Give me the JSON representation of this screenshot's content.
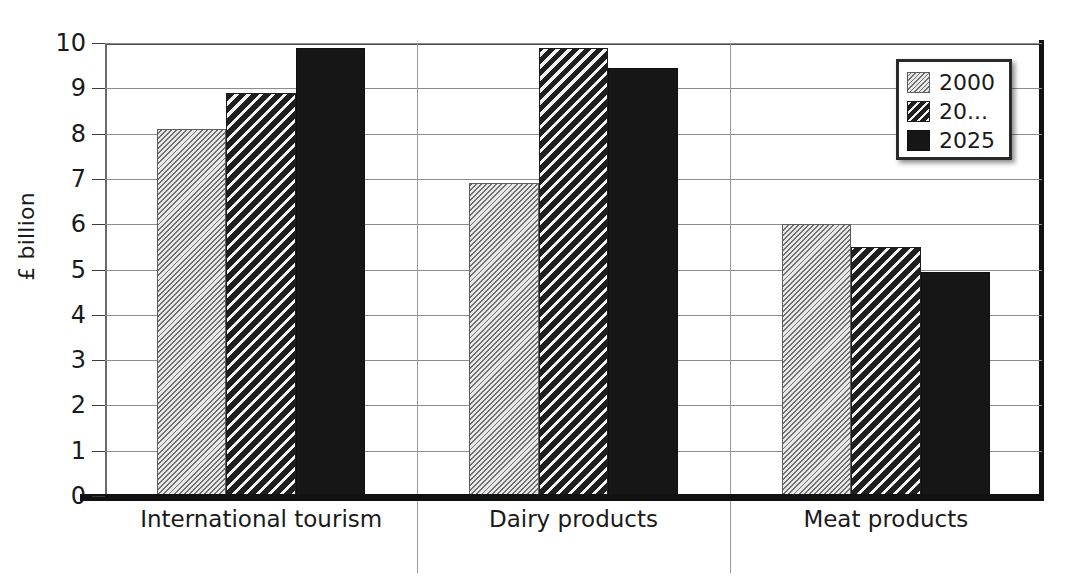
{
  "chart_data": {
    "type": "bar",
    "title": "",
    "xlabel": "",
    "ylabel": "£ billion",
    "ylim": [
      0,
      10
    ],
    "ytick_labels": [
      "0",
      "1",
      "2",
      "3",
      "4",
      "5",
      "6",
      "7",
      "8",
      "9",
      "10"
    ],
    "yticks": [
      0,
      1,
      2,
      3,
      4,
      5,
      6,
      7,
      8,
      9,
      10
    ],
    "grid": true,
    "legend_position": "top-right",
    "categories": [
      "International tourism",
      "Dairy products",
      "Meat products"
    ],
    "series": [
      {
        "name": "2000",
        "values": [
          8.1,
          6.9,
          6.0
        ]
      },
      {
        "name": "20...",
        "values": [
          8.9,
          9.9,
          5.5
        ]
      },
      {
        "name": "2025",
        "values": [
          9.9,
          9.45,
          4.95
        ]
      }
    ]
  },
  "legend": {
    "entries": [
      {
        "label": "2000",
        "swatch": "light-hatch-swatch"
      },
      {
        "label": "20...",
        "swatch": "dark-hatch-swatch"
      },
      {
        "label": "2025",
        "swatch": "solid-black-swatch"
      }
    ]
  },
  "colors": {
    "series_2000": "#d9d9d9",
    "series_20dots": "#1f1f1f",
    "series_2025": "#161616",
    "gridline": "#8c8c8c",
    "axis": "#111111",
    "background": "#ffffff"
  }
}
